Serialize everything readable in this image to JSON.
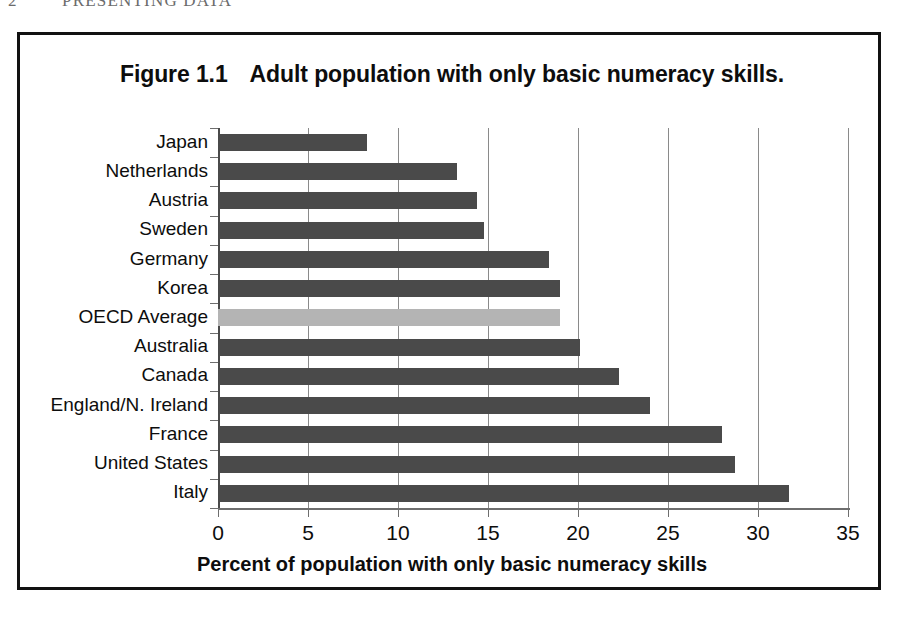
{
  "page_header": {
    "folio": "2",
    "running_title": "PRESENTING DATA"
  },
  "figure": {
    "number": "Figure 1.1",
    "caption": "Adult population with only basic numeracy skills."
  },
  "colors": {
    "bar": "#4a4a4a",
    "highlight_bar": "#b4b4b4",
    "gridline": "#8a8a8a",
    "frame": "#111111",
    "text": "#0d0d0d"
  },
  "chart_data": {
    "type": "bar",
    "orientation": "horizontal",
    "xlabel": "Percent of population with only basic numeracy skills",
    "ylabel": "",
    "xlim": [
      0,
      35
    ],
    "xticks": [
      0,
      5,
      10,
      15,
      20,
      25,
      30,
      35
    ],
    "xtick_labels": [
      "0",
      "5",
      "10",
      "15",
      "20",
      "25",
      "30",
      "35"
    ],
    "grid": true,
    "legend": false,
    "highlight_category": "OECD Average",
    "categories": [
      "Japan",
      "Netherlands",
      "Austria",
      "Sweden",
      "Germany",
      "Korea",
      "OECD Average",
      "Australia",
      "Canada",
      "England/N. Ireland",
      "France",
      "United States",
      "Italy"
    ],
    "values": [
      8.3,
      13.3,
      14.4,
      14.8,
      18.4,
      19.0,
      19.0,
      20.1,
      22.3,
      24.0,
      28.0,
      28.7,
      31.7
    ]
  }
}
